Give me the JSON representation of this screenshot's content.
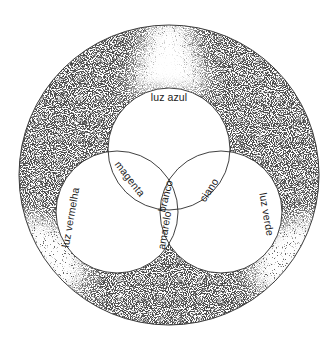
{
  "diagram": {
    "colors": {
      "background": "#ffffff",
      "ink": "#1a1a1a",
      "stipple": "#111111"
    },
    "outer_circle": {
      "cx": 169,
      "cy": 175,
      "r": 150
    },
    "circles": [
      {
        "id": "blue",
        "label": "luz azul",
        "cx": 169,
        "cy": 149,
        "r": 61
      },
      {
        "id": "red",
        "label": "luz vermelha",
        "cx": 117,
        "cy": 212,
        "r": 61
      },
      {
        "id": "green",
        "label": "luz verde",
        "cx": 221,
        "cy": 212,
        "r": 61
      }
    ],
    "labels": {
      "blue_light": "luz azul",
      "red_light": "luz vermelha",
      "green_light": "luz verde",
      "magenta": "magenta",
      "cyan": "ciano",
      "yellow": "amarelo",
      "white": "branco"
    }
  }
}
